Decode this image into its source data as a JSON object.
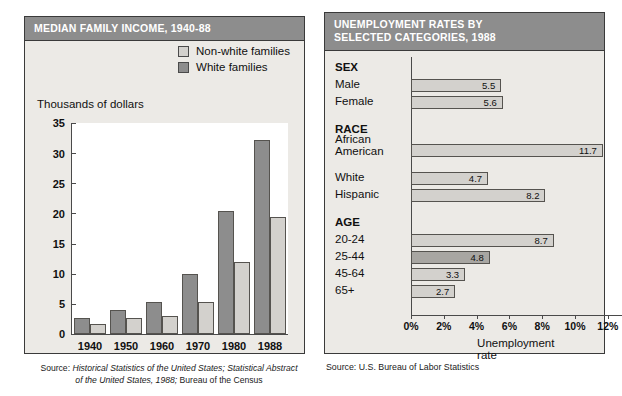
{
  "left_chart": {
    "title": "MEDIAN FAMILY INCOME, 1940-88",
    "axis_caption": "Thousands of dollars",
    "legend": [
      {
        "label": "Non-white families",
        "color": "#d3d1cd",
        "icon": "legend-swatch-icon"
      },
      {
        "label": "White families",
        "color": "#8d8d8d",
        "icon": "legend-swatch-icon"
      }
    ],
    "source_line1_prefix": "Source: ",
    "source_line1_italic": "Historical Statistics of the United States; Statistical Abstract",
    "source_line2_italic": "of the United States, 1988;",
    "source_line2_plain": " Bureau of the Census"
  },
  "right_chart": {
    "title_line1": "UNEMPLOYMENT RATES BY",
    "title_line2": "SELECTED CATEGORIES, 1988",
    "xtitle": "Unemployment rate",
    "source": "Source: U.S. Bureau of Labor Statistics",
    "groups": [
      {
        "heading": "SEX",
        "rows": [
          "Male",
          "Female"
        ]
      },
      {
        "heading": "RACE",
        "rows": [
          "African American",
          "White",
          "Hispanic"
        ]
      },
      {
        "heading": "AGE",
        "rows": [
          "20-24",
          "25-44",
          "45-64",
          "65+"
        ]
      }
    ]
  },
  "chart_data": [
    {
      "type": "bar",
      "title": "MEDIAN FAMILY INCOME, 1940-88",
      "xlabel": "",
      "ylabel": "Thousands of dollars",
      "ylim": [
        0,
        35
      ],
      "yticks": [
        0,
        5,
        10,
        15,
        20,
        25,
        30,
        35
      ],
      "grid": false,
      "legend_position": "top-right",
      "categories": [
        "1940",
        "1950",
        "1960",
        "1970",
        "1980",
        "1988"
      ],
      "series": [
        {
          "name": "White families",
          "color": "#8d8d8d",
          "values": [
            2.7,
            4.0,
            5.4,
            10.1,
            20.5,
            32.3
          ]
        },
        {
          "name": "Non-white families",
          "color": "#d3d1cd",
          "values": [
            1.7,
            2.8,
            3.1,
            5.4,
            12.0,
            19.5
          ]
        }
      ]
    },
    {
      "type": "bar",
      "orientation": "horizontal",
      "title": "UNEMPLOYMENT RATES BY SELECTED CATEGORIES, 1988",
      "xlabel": "Unemployment rate",
      "ylabel": "",
      "xlim": [
        0,
        12
      ],
      "xticks": [
        "0%",
        "2%",
        "4%",
        "6%",
        "8%",
        "10%",
        "12%"
      ],
      "grid": false,
      "categories": [
        "Male",
        "Female",
        "African American",
        "White",
        "Hispanic",
        "20-24",
        "25-44",
        "45-64",
        "65+"
      ],
      "values": [
        5.5,
        5.6,
        11.7,
        4.7,
        8.2,
        8.7,
        4.8,
        3.3,
        2.7
      ],
      "value_labels": [
        "5.5",
        "5.6",
        "11.7",
        "4.7",
        "8.2",
        "8.7",
        "4.8",
        "3.3",
        "2.7"
      ],
      "highlighted": [
        "25-44"
      ],
      "group_headings": [
        "SEX",
        "RACE",
        "AGE"
      ]
    }
  ]
}
